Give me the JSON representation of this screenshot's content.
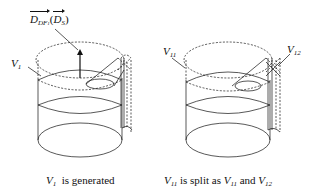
{
  "figure": {
    "left_panel": {
      "vector_label": {
        "base": "D",
        "sub": "DF",
        "subsub": "1",
        "arg_base": "D",
        "arg_sub": "S"
      },
      "volume_label": {
        "base": "V",
        "sub": "1"
      },
      "caption": {
        "var_base": "V",
        "var_sub": "1",
        "text": "is generated"
      }
    },
    "right_panel": {
      "label_a": {
        "base": "V",
        "sub": "11"
      },
      "label_b": {
        "base": "V",
        "sub": "12"
      },
      "caption": {
        "var1_base": "V",
        "var1_sub": "11",
        "text1": "is split as",
        "var2_base": "V",
        "var2_sub": "11",
        "text2": "and",
        "var3_base": "V",
        "var3_sub": "12"
      }
    },
    "colors": {
      "stroke": "#111111",
      "background": "#ffffff"
    }
  }
}
